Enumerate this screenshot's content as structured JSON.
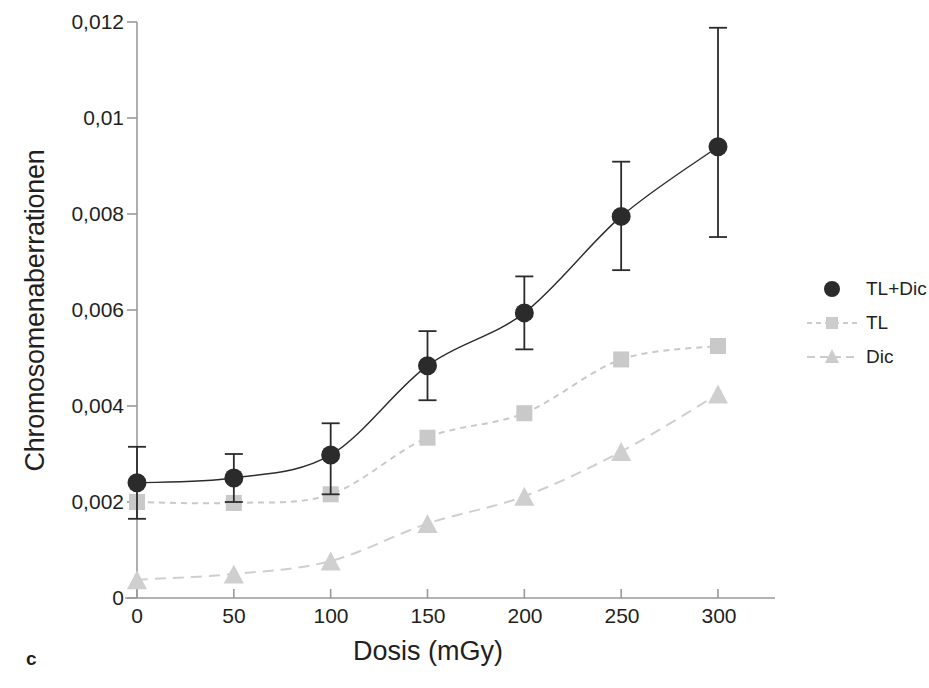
{
  "panel": {
    "letter": "c"
  },
  "chart_data": {
    "type": "scatter",
    "title": "",
    "xlabel": "Dosis (mGy)",
    "ylabel": "Chromosomenaberrationen",
    "x": [
      0,
      50,
      100,
      150,
      200,
      250,
      300
    ],
    "xlim": [
      0,
      320
    ],
    "ylim": [
      0,
      0.012
    ],
    "xticks": [
      0,
      50,
      100,
      150,
      200,
      250,
      300
    ],
    "xtick_labels": [
      "0",
      "50",
      "100",
      "150",
      "200",
      "250",
      "300"
    ],
    "yticks": [
      0,
      0.002,
      0.004,
      0.006,
      0.008,
      0.01,
      0.012
    ],
    "ytick_labels": [
      "0",
      "0,002",
      "0,004",
      "0,006",
      "0,008",
      "0,01",
      "0,012"
    ],
    "grid": false,
    "legend_position": "right",
    "series": [
      {
        "name": "TL+Dic",
        "marker": "circle",
        "color": "#2b2b2b",
        "line_style": "solid",
        "values": [
          0.0024,
          0.0025,
          0.00298,
          0.00484,
          0.00594,
          0.00795,
          0.0094
        ],
        "err_low": [
          0.00165,
          0.002,
          0.00216,
          0.00412,
          0.00518,
          0.00683,
          0.00752
        ],
        "err_high": [
          0.00315,
          0.003,
          0.00364,
          0.00556,
          0.0067,
          0.00909,
          0.01188
        ]
      },
      {
        "name": "TL",
        "marker": "square",
        "color": "#c9c9c9",
        "line_style": "dashed-short",
        "values": [
          0.002,
          0.00198,
          0.00216,
          0.00334,
          0.00385,
          0.00497,
          0.00525
        ]
      },
      {
        "name": "Dic",
        "marker": "triangle",
        "color": "#cfcfcf",
        "line_style": "dashed-long",
        "values": [
          0.00038,
          0.0005,
          0.00077,
          0.00155,
          0.00212,
          0.00305,
          0.00425
        ]
      }
    ]
  },
  "legend": {
    "items": [
      {
        "label": "TL+Dic"
      },
      {
        "label": "TL"
      },
      {
        "label": "Dic"
      }
    ]
  },
  "colors": {
    "axis": "#9a9a9a",
    "dark_series": "#2b2b2b",
    "light_series": "#cccccc",
    "text": "#231f20"
  }
}
